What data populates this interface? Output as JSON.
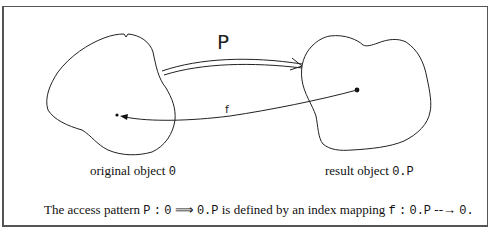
{
  "diagram": {
    "left_object": {
      "label_text": "original object",
      "label_symbol": "0"
    },
    "right_object": {
      "label_text": "result object",
      "label_symbol": "0.P"
    },
    "forward_arrow": {
      "label": "P",
      "style": "double-line"
    },
    "backward_arrow": {
      "label": "f",
      "style": "single-line"
    },
    "caption": {
      "t1": "The access pattern",
      "m1": "P",
      "m2": ":",
      "m3": "0",
      "m4": "⟹",
      "m5": "0.P",
      "t2": "is defined by an index mapping",
      "m6": "f",
      "m7": ":",
      "m8": "0.P",
      "m9": "--→",
      "m10": "0."
    },
    "colors": {
      "ink": "#222222",
      "frame": "#555555",
      "background": "#ffffff"
    }
  }
}
